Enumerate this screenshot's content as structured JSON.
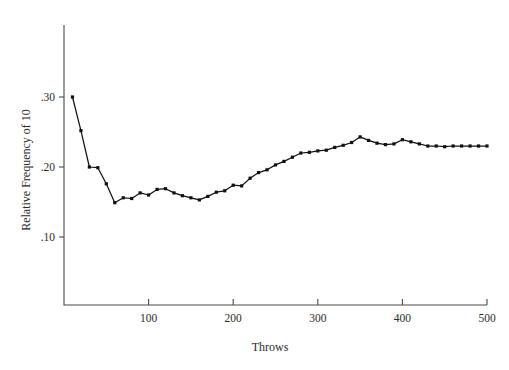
{
  "chart_data": {
    "type": "line",
    "title": "",
    "xlabel": "Throws",
    "ylabel": "Relative Frequency of 10",
    "xlim": [
      0,
      500
    ],
    "ylim": [
      0.0,
      0.345
    ],
    "grid": false,
    "legend": "none",
    "xticks": [
      100,
      200,
      300,
      400,
      500
    ],
    "xtick_labels": [
      "100",
      "200",
      "300",
      "400",
      "500"
    ],
    "yticks": [
      0.1,
      0.2,
      0.3
    ],
    "ytick_labels": [
      ".10",
      ".20",
      ".30"
    ],
    "marker": "square",
    "line_color": "#111111",
    "x": [
      10,
      20,
      30,
      40,
      50,
      60,
      70,
      80,
      90,
      100,
      110,
      120,
      130,
      140,
      150,
      160,
      170,
      180,
      190,
      200,
      210,
      220,
      230,
      240,
      250,
      260,
      270,
      280,
      290,
      300,
      310,
      320,
      330,
      340,
      350,
      360,
      370,
      380,
      390,
      400,
      410,
      420,
      430,
      440,
      450,
      460,
      470,
      480,
      490,
      500
    ],
    "y": [
      0.3,
      0.252,
      0.2,
      0.199,
      0.176,
      0.149,
      0.156,
      0.155,
      0.163,
      0.16,
      0.168,
      0.169,
      0.163,
      0.159,
      0.156,
      0.153,
      0.158,
      0.164,
      0.166,
      0.174,
      0.173,
      0.184,
      0.192,
      0.196,
      0.203,
      0.208,
      0.214,
      0.22,
      0.221,
      0.223,
      0.224,
      0.228,
      0.231,
      0.235,
      0.243,
      0.238,
      0.234,
      0.232,
      0.233,
      0.239,
      0.236,
      0.233,
      0.23,
      0.23,
      0.229,
      0.23,
      0.23,
      0.23,
      0.23,
      0.23
    ]
  },
  "axes_pixels": {
    "x0": 64,
    "x1": 487,
    "xval0": 0,
    "xval1": 500,
    "y0": 237,
    "y1": 97,
    "yval0": 0.1,
    "yval1": 0.3,
    "axis_top": 25,
    "axis_bottom": 305
  }
}
